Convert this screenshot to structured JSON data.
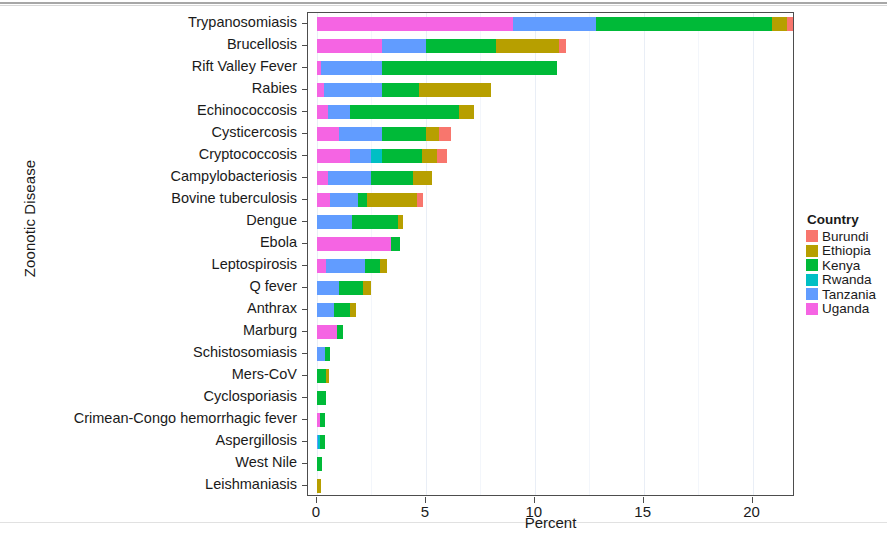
{
  "chart_data": {
    "type": "bar",
    "orientation": "horizontal",
    "stacked": true,
    "title": "",
    "xlabel": "Percent",
    "ylabel": "Zoonotic Disease",
    "xlim": [
      0,
      22.3
    ],
    "xticks": [
      0,
      5,
      10,
      15,
      20
    ],
    "xtick_labels": [
      "0",
      "5",
      "10",
      "15",
      "20"
    ],
    "grid": true,
    "legend_title": "Country",
    "legend_position": "right",
    "categories": [
      "Trypanosomiasis",
      "Brucellosis",
      "Rift Valley Fever",
      "Rabies",
      "Echinococcosis",
      "Cysticercosis",
      "Cryptococcosis",
      "Campylobacteriosis",
      "Bovine tuberculosis",
      "Dengue",
      "Ebola",
      "Leptospirosis",
      "Q fever",
      "Anthrax",
      "Marburg",
      "Schistosomiasis",
      "Mers-CoV",
      "Cyclosporiasis",
      "Crimean-Congo hemorrhagic fever",
      "Aspergillosis",
      "West Nile",
      "Leishmaniasis"
    ],
    "series": [
      {
        "name": "Burundi",
        "color": "#F8766D",
        "values": [
          0.25,
          0.35,
          0.0,
          0.0,
          0.0,
          0.55,
          0.45,
          0.0,
          0.25,
          0.0,
          0.0,
          0.0,
          0.0,
          0.0,
          0.0,
          0.0,
          0.0,
          0.0,
          0.0,
          0.0,
          0.0,
          0.0
        ]
      },
      {
        "name": "Ethiopia",
        "color": "#B79F00",
        "values": [
          0.7,
          2.9,
          0.0,
          3.3,
          0.7,
          0.6,
          0.7,
          0.9,
          2.3,
          0.25,
          0.0,
          0.3,
          0.4,
          0.3,
          0.0,
          0.0,
          0.15,
          0.0,
          0.0,
          0.0,
          0.0,
          0.2
        ]
      },
      {
        "name": "Kenya",
        "color": "#00BA38",
        "values": [
          8.1,
          3.2,
          8.0,
          1.7,
          5.0,
          2.0,
          1.8,
          1.9,
          0.4,
          2.1,
          0.4,
          0.7,
          1.1,
          0.7,
          0.3,
          0.25,
          0.4,
          0.4,
          0.2,
          0.2,
          0.25,
          0.0
        ]
      },
      {
        "name": "Rwanda",
        "color": "#00BFC4",
        "values": [
          0.0,
          0.0,
          0.0,
          0.0,
          0.0,
          0.0,
          0.5,
          0.0,
          0.0,
          0.0,
          0.0,
          0.0,
          0.0,
          0.0,
          0.0,
          0.0,
          0.0,
          0.0,
          0.0,
          0.1,
          0.0,
          0.0
        ]
      },
      {
        "name": "Tanzania",
        "color": "#619CFF",
        "values": [
          3.8,
          2.0,
          2.8,
          2.7,
          1.0,
          2.0,
          1.0,
          2.0,
          1.3,
          1.6,
          0.0,
          1.8,
          1.0,
          0.8,
          0.0,
          0.35,
          0.0,
          0.0,
          0.0,
          0.05,
          0.0,
          0.0
        ]
      },
      {
        "name": "Uganda",
        "color": "#F564E3",
        "values": [
          9.0,
          3.0,
          0.2,
          0.3,
          0.5,
          1.0,
          1.5,
          0.5,
          0.6,
          0.0,
          3.4,
          0.4,
          0.0,
          0.0,
          0.9,
          0.0,
          0.0,
          0.0,
          0.15,
          0.0,
          0.0,
          0.0
        ]
      }
    ]
  },
  "axes": {
    "x_title": "Percent",
    "y_title": "Zoonotic Disease"
  },
  "legend": {
    "title": "Country",
    "items": [
      {
        "label": "Burundi",
        "color": "#F8766D"
      },
      {
        "label": "Ethiopia",
        "color": "#B79F00"
      },
      {
        "label": "Kenya",
        "color": "#00BA38"
      },
      {
        "label": "Rwanda",
        "color": "#00BFC4"
      },
      {
        "label": "Tanzania",
        "color": "#619CFF"
      },
      {
        "label": "Uganda",
        "color": "#F564E3"
      }
    ]
  }
}
